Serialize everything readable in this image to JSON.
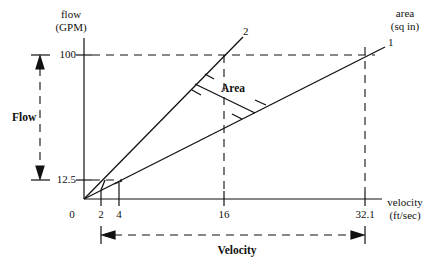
{
  "y_axis": {
    "title_line1": "flow",
    "title_line2": "(GPM)",
    "ticks": [
      "100",
      "12.5"
    ]
  },
  "x_axis": {
    "title_line1": "velocity",
    "title_line2": "(ft/sec)",
    "ticks": [
      "0",
      "2",
      "4",
      "16",
      "32.1"
    ]
  },
  "series_label": {
    "title_line1": "area",
    "title_line2": "(sq in)"
  },
  "lines": [
    {
      "id": "1",
      "label": "1",
      "description": "larger area line (shallower slope)"
    },
    {
      "id": "2",
      "label": "2",
      "description": "smaller area line (steeper slope)"
    }
  ],
  "annotations": {
    "area_label": "Area",
    "flow_range_label": "Flow",
    "velocity_range_label": "Velocity"
  },
  "colors": {
    "stroke": "#111111",
    "background": "#ffffff"
  }
}
